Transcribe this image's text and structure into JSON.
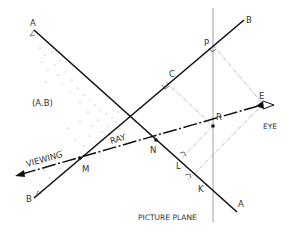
{
  "diagram": {
    "colors": {
      "line": "#111111",
      "thin": "#888888",
      "dash": "#999999",
      "text": "#333333"
    },
    "labels": {
      "a_top": "A",
      "a_bottom": "A",
      "b_top": "B",
      "b_bottom": "B",
      "region": "(A.B)",
      "p": "P",
      "c": "C",
      "r": "R",
      "e": "E",
      "eye": "EYE",
      "n": "N",
      "l": "L",
      "k": "K",
      "m": "M",
      "viewing": "VIEWING",
      "ray": "RAY",
      "picture_plane": "PICTURE PLANE"
    },
    "icons": {
      "eye": "eye-icon",
      "arrowhead": "arrowhead-icon"
    }
  }
}
